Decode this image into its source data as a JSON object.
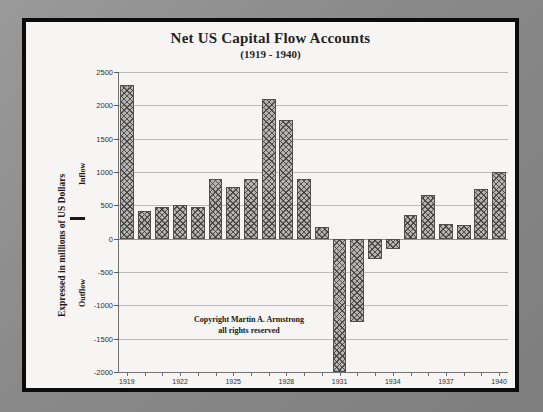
{
  "figure": {
    "title_main": "Net US Capital Flow Accounts",
    "title_sub": "(1919 - 1940)",
    "y_axis_label": "Expressed in millions of US Dollars",
    "inflow_label": "Inflow",
    "outflow_label": "Outflow",
    "copyright_line1": "Copyright Martin A. Armstrong",
    "copyright_line2": "all rights reserved",
    "bar_fill_color": "#b4b2ae",
    "bar_edge_color": "#4a4a4a",
    "grid_color": "#b9b9b9",
    "paper_color": "#f6f5f3",
    "frame_color": "#0c0c0c"
  },
  "chart_data": {
    "type": "bar",
    "title": "Net US Capital Flow Accounts (1919 - 1940)",
    "xlabel": "",
    "ylabel": "Expressed in millions of US Dollars",
    "ylim": [
      -2000,
      2500
    ],
    "ytick_values": [
      2500,
      2000,
      1500,
      1000,
      500,
      0,
      -500,
      -1000,
      -1500,
      -2000
    ],
    "ytick_labels": [
      "2500",
      "2000",
      "1500",
      "1000",
      "500",
      "0",
      "-500",
      "-1000",
      "-1500",
      "-2000"
    ],
    "xtick_labels": [
      "1919",
      "1922",
      "1925",
      "1928",
      "1931",
      "1934",
      "1937",
      "1940"
    ],
    "grid": true,
    "legend": "none",
    "categories": [
      "1919",
      "1920",
      "1921",
      "1922",
      "1923",
      "1924",
      "1925",
      "1926",
      "1927",
      "1928",
      "1929",
      "1930",
      "1931",
      "1932",
      "1933",
      "1934",
      "1935",
      "1936",
      "1937",
      "1938",
      "1939",
      "1940"
    ],
    "values": [
      2300,
      420,
      470,
      500,
      480,
      900,
      775,
      900,
      2100,
      1775,
      900,
      180,
      -2000,
      -1250,
      -300,
      -150,
      350,
      650,
      220,
      200,
      750,
      1000
    ],
    "annotations": [
      "Copyright Martin A. Armstrong",
      "all rights reserved"
    ]
  }
}
